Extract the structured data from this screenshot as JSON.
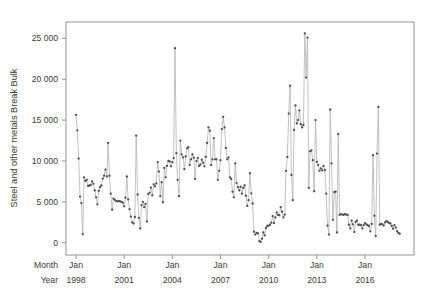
{
  "chart_data": {
    "type": "line",
    "title": "",
    "subtitle": "",
    "xlabel": "",
    "ylabel": "Steel and other metals Break Bulk",
    "ylim": [
      -1500,
      27000
    ],
    "ytick_labels": [
      "0",
      "5 000",
      "10 000",
      "15 000",
      "20 000",
      "25 000"
    ],
    "ytick_values": [
      0,
      5000,
      10000,
      15000,
      20000,
      25000
    ],
    "grid": false,
    "legend": null,
    "marker": "filled-circle",
    "marker_color": "#4d4d4d",
    "line_color": "#b3b3b3",
    "frame_color": "#8a8a8a",
    "x_axis_rows": [
      {
        "name": "Month",
        "labels": [
          "Jan",
          "Jan",
          "Jan",
          "Jan",
          "Jan",
          "Jan",
          "Jan"
        ]
      },
      {
        "name": "Year",
        "labels": [
          "1998",
          "2001",
          "2004",
          "2007",
          "2010",
          "2013",
          "2016"
        ]
      }
    ],
    "xtick_index": [
      0,
      36,
      72,
      108,
      144,
      180,
      216
    ],
    "x_start": "1998-01",
    "x_freq": "monthly",
    "n_points": 240,
    "values": [
      15650,
      13750,
      10300,
      5650,
      4850,
      1050,
      8000,
      7550,
      7700,
      6950,
      7000,
      7050,
      7500,
      7200,
      6400,
      5550,
      4700,
      6350,
      6800,
      7000,
      7850,
      8200,
      8950,
      8100,
      12200,
      8200,
      6000,
      4050,
      5400,
      5250,
      5100,
      5050,
      5100,
      5050,
      5000,
      4900,
      4450,
      5500,
      8100,
      5300,
      4100,
      3200,
      2500,
      2350,
      3150,
      13100,
      5900,
      3050,
      1750,
      4600,
      5000,
      4350,
      4750,
      2600,
      5950,
      6100,
      6750,
      5800,
      7150,
      6900,
      7250,
      9850,
      8700,
      5700,
      7400,
      4950,
      9150,
      8000,
      9400,
      10000,
      9950,
      9350,
      9850,
      10350,
      23800,
      10950,
      7700,
      5700,
      12500,
      10800,
      10450,
      9000,
      10550,
      11550,
      11700,
      9500,
      10200,
      10800,
      10400,
      7800,
      10000,
      10350,
      9400,
      9550,
      10150,
      9800,
      9350,
      10500,
      12200,
      14100,
      13700,
      9500,
      10200,
      12800,
      10200,
      10200,
      7700,
      8800,
      10100,
      13900,
      15400,
      14100,
      11600,
      10200,
      10450,
      8000,
      7800,
      6250,
      5550,
      9700,
      7300,
      6800,
      6400,
      6850,
      6000,
      6700,
      7000,
      5750,
      4500,
      5200,
      8500,
      6050,
      4800,
      1350,
      1000,
      1200,
      1150,
      200,
      100,
      500,
      1250,
      900,
      1800,
      2050,
      2100,
      2200,
      2450,
      3250,
      2400,
      3100,
      3700,
      3400,
      3350,
      4350,
      3800,
      3100,
      3450,
      8800,
      10500,
      15800,
      19200,
      8300,
      5200,
      13800,
      16800,
      14600,
      15000,
      16200,
      14500,
      14100,
      14400,
      25600,
      20200,
      25100,
      6700,
      11200,
      11300,
      10100,
      6300,
      15000,
      9900,
      9500,
      8800,
      9100,
      8850,
      9400,
      8900,
      6000,
      2100,
      1000,
      16300,
      9700,
      2800,
      6200,
      6250,
      1250,
      13300,
      3400,
      3500,
      3450,
      3400,
      3500,
      3450,
      3400,
      2200,
      1750,
      2700,
      2250,
      1300,
      2550,
      2700,
      2200,
      2200,
      2150,
      1750,
      2150,
      2400,
      2250,
      2150,
      2050,
      1400,
      2300,
      10700,
      3300,
      800,
      10900,
      16600,
      2200,
      2300,
      2250,
      2100,
      2500,
      2650,
      2550,
      2400,
      2350,
      2050,
      1700,
      2150,
      1850,
      1400,
      1200,
      1100
    ]
  }
}
